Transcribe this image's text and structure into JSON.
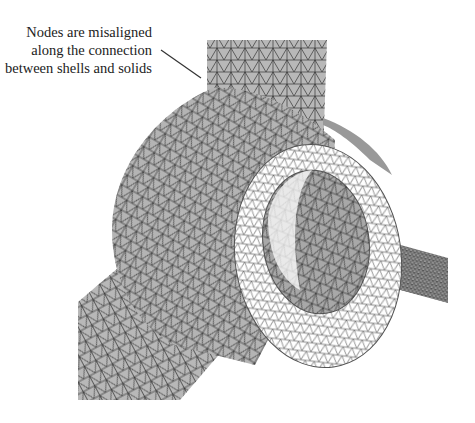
{
  "figure": {
    "colors": {
      "background": "#ffffff",
      "shell_fill": "#b8b8b8",
      "solid_outer_fill": "#b4b4b4",
      "ring_face_fill": "#ffffff",
      "bore_fill": "#a8a8a8",
      "mesh_line": "#333333",
      "leader_line": "#333333",
      "text": "#222222"
    }
  },
  "annotation": {
    "lines": [
      "Nodes are misaligned",
      "along the connection",
      "between shells and solids"
    ]
  }
}
